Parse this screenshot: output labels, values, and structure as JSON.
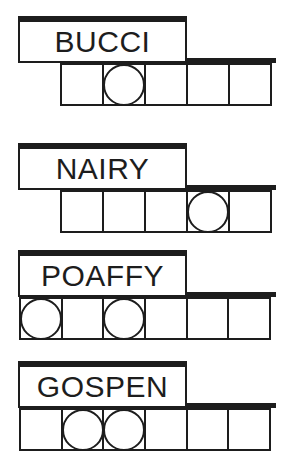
{
  "puzzle": {
    "type": "jumble-word-scramble",
    "ink_color": "#1d1d1d",
    "background_color": "#ffffff",
    "groups": [
      {
        "word": "BUCCI",
        "cell_count": 5,
        "circled_cells": [
          2
        ],
        "row_align": "indented"
      },
      {
        "word": "NAIRY",
        "cell_count": 5,
        "circled_cells": [
          4
        ],
        "row_align": "indented"
      },
      {
        "word": "POAFFY",
        "cell_count": 6,
        "circled_cells": [
          1,
          3
        ],
        "row_align": "flush"
      },
      {
        "word": "GOSPEN",
        "cell_count": 6,
        "circled_cells": [
          2,
          3
        ],
        "row_align": "flush"
      }
    ]
  }
}
